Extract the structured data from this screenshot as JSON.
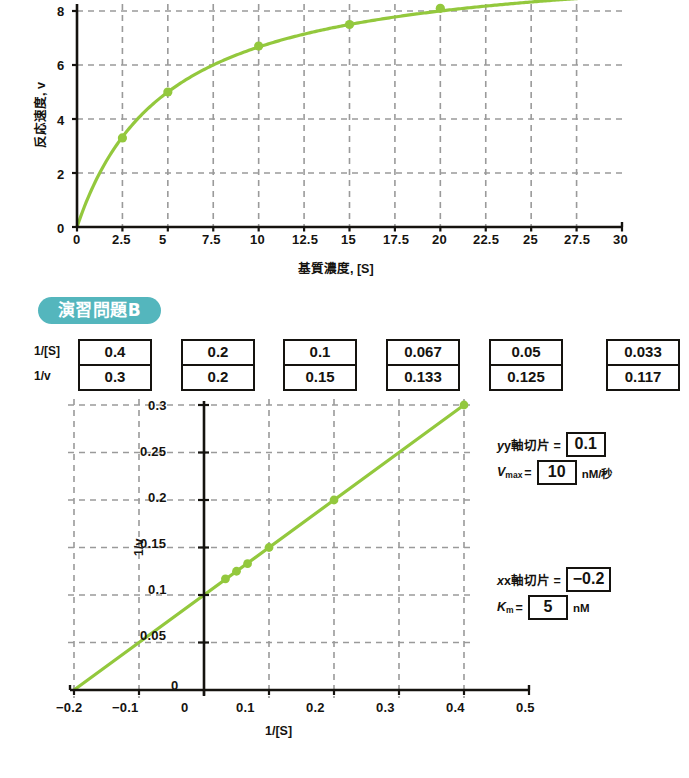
{
  "badge": {
    "label": "演習問題B"
  },
  "colors": {
    "curve": "#93c83d",
    "grid": "#9a9a9a",
    "axis": "#15130f",
    "badge": "#54b6bd"
  },
  "table": {
    "row_labels": [
      "1/[S]",
      "1/v"
    ],
    "inv_s": [
      "0.4",
      "0.2",
      "0.1",
      "0.067",
      "0.05",
      "0.033"
    ],
    "inv_v": [
      "0.3",
      "0.2",
      "0.15",
      "0.133",
      "0.125",
      "0.117"
    ]
  },
  "annotations": {
    "y_intercept_label": "y軸切片 =",
    "y_intercept_value": "0.1",
    "vmax_label": "V",
    "vmax_sub": "max",
    "vmax_eq": "=",
    "vmax_value": "10",
    "vmax_unit": "nM/秒",
    "x_intercept_label": "x軸切片 =",
    "x_intercept_value": "−0.2",
    "km_label": "K",
    "km_sub": "m",
    "km_eq": "=",
    "km_value": "5",
    "km_unit": "nM"
  },
  "chart_data": [
    {
      "type": "line",
      "id": "michaelis-menten",
      "title": "",
      "xlabel": "基質濃度, [S]",
      "ylabel": "反応速度, v",
      "xlim": [
        0,
        30
      ],
      "ylim": [
        0,
        8.8
      ],
      "grid": true,
      "xticks": [
        "0",
        "2.5",
        "5",
        "7.5",
        "10",
        "12.5",
        "15",
        "17.5",
        "20",
        "22.5",
        "25",
        "27.5",
        "30"
      ],
      "xtick_values": [
        0,
        2.5,
        5,
        7.5,
        10,
        12.5,
        15,
        17.5,
        20,
        22.5,
        25,
        27.5,
        30
      ],
      "yticks": [
        "0",
        "2",
        "4",
        "6",
        "8"
      ],
      "ytick_values": [
        0,
        2,
        4,
        6,
        8
      ],
      "markers_x": [
        2.5,
        5,
        10,
        15,
        20
      ],
      "markers_y": [
        3.3,
        5.0,
        6.7,
        7.5,
        8.1
      ],
      "curve_note": "v = 10[S]/(5+[S]) hyperbola from origin, Vmax 10, Km 5"
    },
    {
      "type": "line",
      "id": "lineweaver-burk",
      "title": "",
      "xlabel": "1/[S]",
      "ylabel": "1/v",
      "xlim": [
        -0.2,
        0.5
      ],
      "ylim": [
        0,
        0.3
      ],
      "grid": true,
      "xticks": [
        "−0.2",
        "−0.1",
        "0",
        "0.1",
        "0.2",
        "0.3",
        "0.4",
        "0.5"
      ],
      "xtick_values": [
        -0.2,
        -0.1,
        0,
        0.1,
        0.2,
        0.3,
        0.4,
        0.5
      ],
      "yticks": [
        "0",
        "0.05",
        "0.1",
        "0.15",
        "0.2",
        "0.25",
        "0.3"
      ],
      "ytick_values": [
        0,
        0.05,
        0.1,
        0.15,
        0.2,
        0.25,
        0.3
      ],
      "x": [
        0.033,
        0.05,
        0.067,
        0.1,
        0.2,
        0.4
      ],
      "y": [
        0.117,
        0.125,
        0.133,
        0.15,
        0.2,
        0.3
      ],
      "fit_line": {
        "from": [
          -0.2,
          0
        ],
        "to": [
          0.4,
          0.3
        ],
        "slope": 0.5,
        "intercept": 0.1
      }
    }
  ]
}
